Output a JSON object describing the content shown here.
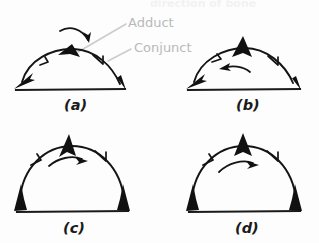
{
  "page": {
    "background_color": "#fdfdfd",
    "ink_color": "#111111",
    "annotation_color": "#b9b9b9",
    "width": 319,
    "height": 243
  },
  "header": {
    "text": "direction of bone",
    "note": "faded, cropped at top edge"
  },
  "annotations": [
    {
      "id": "adduct",
      "label": "Adduct",
      "x": 128,
      "y": 27,
      "target_x": 78,
      "target_y": 52
    },
    {
      "id": "conjunct",
      "label": "Conjunct",
      "x": 132,
      "y": 52,
      "target_x": 108,
      "target_y": 62
    }
  ],
  "panels": [
    {
      "id": "a",
      "label": "(a)",
      "label_x": 72,
      "label_y": 107,
      "arch": "wide low arch",
      "end_arrows": "both ends point outward and downward toward the baseline",
      "apex_marker": "broad flat filled wedge",
      "extra_arrow": "small curved arrow above the apex pointing down and to the right",
      "mid_arrow": "tick arrow on right limb pointing down-right"
    },
    {
      "id": "b",
      "label": "(b)",
      "label_x": 243,
      "label_y": 107,
      "arch": "wide low arch",
      "end_arrows": "both ends point outward and downward toward the baseline",
      "apex_marker": "tall narrow filled spike",
      "extra_arrow": "curved arrow inside the arch pointing to the left",
      "mid_arrow": "tick arrows on both limbs pointing outward"
    },
    {
      "id": "c",
      "label": "(c)",
      "label_x": 72,
      "label_y": 230,
      "arch": "tall semicircular arch",
      "end_arrows": "both ends point upward away from the baseline",
      "apex_marker": "filled triangle leaning left",
      "extra_arrow": "curved arrow inside the arch pointing up and to the right",
      "mid_arrow": "tick arrows on both limbs pointing toward the apex"
    },
    {
      "id": "d",
      "label": "(d)",
      "label_x": 243,
      "label_y": 230,
      "arch": "tall semicircular arch",
      "end_arrows": "both ends point upward away from the baseline",
      "apex_marker": "upright filled triangle",
      "extra_arrow": "curved arrow inside the arch pointing up and to the right",
      "mid_arrow": "tick arrows on both limbs pointing toward the apex"
    }
  ]
}
